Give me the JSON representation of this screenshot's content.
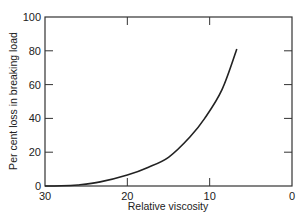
{
  "chart_data": {
    "type": "line",
    "title": "",
    "xlabel": "Relative viscosity",
    "ylabel": "Per cent loss in breaking load",
    "xlim": [
      30,
      0
    ],
    "ylim": [
      0,
      100
    ],
    "x_ticks": [
      30,
      20,
      10,
      0
    ],
    "y_ticks": [
      0,
      20,
      40,
      60,
      80,
      100
    ],
    "x_tick_labels": [
      "30",
      "20",
      "10",
      "0"
    ],
    "y_tick_labels": [
      "0",
      "20",
      "40",
      "60",
      "80",
      "100"
    ],
    "grid": false,
    "legend": "none",
    "series": [
      {
        "name": "loss",
        "x": [
          30,
          28,
          26,
          23.3,
          20,
          17.5,
          15,
          12.4,
          10.6,
          8.5,
          6.7
        ],
        "y": [
          0,
          0.1,
          0.6,
          2.4,
          6.5,
          11,
          17,
          29,
          40,
          57,
          81
        ]
      }
    ]
  }
}
